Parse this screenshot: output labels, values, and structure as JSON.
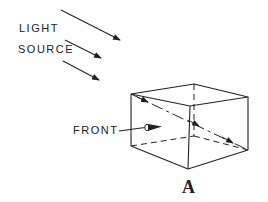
{
  "diagram": {
    "labels": {
      "light": "LIGHT",
      "source": "SOURCE",
      "front": "FRONT",
      "figure": "A"
    },
    "colors": {
      "stroke": "#222222",
      "background": "#ffffff"
    },
    "light_rays": [
      {
        "from": [
          61,
          10
        ],
        "to": [
          120,
          40
        ]
      },
      {
        "from": [
          65,
          40
        ],
        "to": [
          101,
          58
        ]
      },
      {
        "from": [
          63,
          61
        ],
        "to": [
          99,
          80
        ]
      }
    ],
    "box": {
      "front_top_left": [
        131,
        94
      ],
      "front_top_right": [
        190,
        106
      ],
      "front_bottom_left": [
        131,
        146
      ],
      "front_bottom_right": [
        188,
        169
      ],
      "back_top_left": [
        194,
        84
      ],
      "back_top_right": [
        248,
        97
      ],
      "back_bottom_right": [
        248,
        150
      ],
      "back_bottom_left_hidden": [
        194,
        136
      ]
    },
    "diagonal_ray": {
      "from": [
        131,
        94
      ],
      "to": [
        248,
        150
      ]
    }
  }
}
